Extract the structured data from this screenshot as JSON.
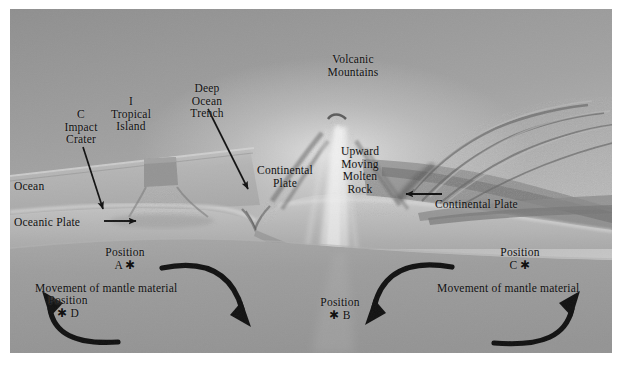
{
  "figure": {
    "background_color": "#9a9a9a",
    "ink_color": "#111111"
  },
  "labels": {
    "impact_crater": "C\nImpact\nCrater",
    "tropical_island": "I\nTropical\nIsland",
    "deep_ocean_trench": "Deep\nOcean\nTrench",
    "volcanic_mountains": "Volcanic\nMountains",
    "continental_plate_left": "Continental\nPlate",
    "upward_moving_molten_rock": "Upward\nMoving\nMolten\nRock",
    "ocean": "Ocean",
    "oceanic_plate": "Oceanic Plate",
    "continental_plate_right": "Continental Plate",
    "movement_of_mantle_material_left": "Movement of mantle material",
    "movement_of_mantle_material_right": "Movement of mantle material"
  },
  "positions": [
    {
      "name": "position-a",
      "label": "Position",
      "letter": "A",
      "marker": "*",
      "marker_side": "after"
    },
    {
      "name": "position-b",
      "label": "Position",
      "letter": "B",
      "marker": "*",
      "marker_side": "before"
    },
    {
      "name": "position-c",
      "label": "Position",
      "letter": "C",
      "marker": "*",
      "marker_side": "after"
    },
    {
      "name": "position-d",
      "label": "Position",
      "letter": "D",
      "marker": "*",
      "marker_side": "before"
    }
  ],
  "position_text": {
    "a_line1": "Position",
    "a_line2": "A ✱",
    "b_line1": "Position",
    "b_line2": "✱ B",
    "c_line1": "Position",
    "c_line2": "C ✱",
    "d_line1": "Position",
    "d_line2": "✱ D"
  },
  "arrows": {
    "trench_pointer": "arrow pointing down to the deep ocean trench",
    "crater_pointer": "arrow pointing down to the impact crater",
    "oceanic_plate_direction": "arrow pointing right (oceanic plate moves right)",
    "continental_plate_direction": "arrow pointing left (continental plate moves left)",
    "mantle_left_cell": "clockwise convection loop under the oceanic plate",
    "mantle_right_cell": "counter-clockwise convection loop under the continental plate"
  }
}
